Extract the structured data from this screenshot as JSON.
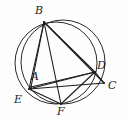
{
  "figure": {
    "canvas": {
      "width": 127,
      "height": 121
    },
    "colors": {
      "background": "#fdfdfd",
      "stroke": "#1c1c1c",
      "circle_stroke": "#2a2a2a",
      "label": "#1c1c1c"
    },
    "stroke_widths": {
      "circle": 1.0,
      "chord": 1.1
    }
  },
  "points": [
    {
      "id": "A",
      "label": "A",
      "x": 31,
      "y": 87,
      "label_x": 31,
      "label_y": 71
    },
    {
      "id": "B",
      "label": "B",
      "x": 44,
      "y": 22,
      "label_x": 35,
      "label_y": 5
    },
    {
      "id": "C",
      "label": "C",
      "x": 104,
      "y": 83,
      "label_x": 108,
      "label_y": 80
    },
    {
      "id": "D",
      "label": "D",
      "x": 95,
      "y": 72,
      "label_x": 97,
      "label_y": 60
    },
    {
      "id": "E",
      "label": "E",
      "x": 29,
      "y": 89,
      "label_x": 14,
      "label_y": 94
    },
    {
      "id": "F",
      "label": "F",
      "x": 61,
      "y": 104,
      "label_x": 57,
      "label_y": 106
    }
  ],
  "circles": [
    {
      "id": "circle-large",
      "name": "large-circle",
      "cx": 63,
      "cy": 62,
      "r": 42
    },
    {
      "id": "circle-small",
      "name": "small-circle",
      "cx": 56,
      "cy": 63,
      "r": 41
    }
  ],
  "segments": [
    {
      "id": "seg-BE",
      "from": "B",
      "to": "E"
    },
    {
      "id": "seg-BA",
      "from": "B",
      "to": "A"
    },
    {
      "id": "seg-BF",
      "from": "B",
      "to": "F"
    },
    {
      "id": "seg-BD",
      "from": "B",
      "to": "D"
    },
    {
      "id": "seg-BC",
      "from": "B",
      "to": "C"
    },
    {
      "id": "seg-EC",
      "from": "E",
      "to": "C"
    },
    {
      "id": "seg-EF",
      "from": "E",
      "to": "F"
    },
    {
      "id": "seg-ED",
      "from": "E",
      "to": "D"
    },
    {
      "id": "seg-AD",
      "from": "A",
      "to": "D"
    },
    {
      "id": "seg-FD",
      "from": "F",
      "to": "D"
    },
    {
      "id": "seg-DC",
      "from": "D",
      "to": "C"
    }
  ]
}
